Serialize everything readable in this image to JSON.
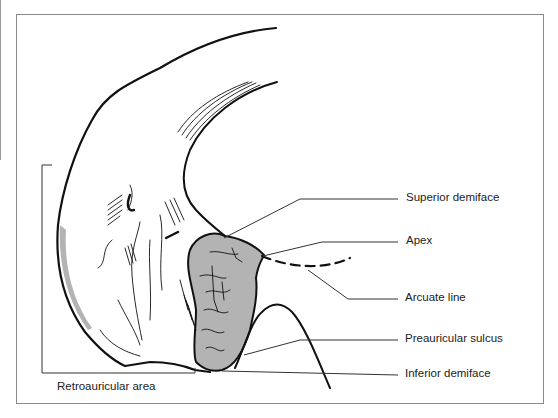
{
  "figure": {
    "labels": {
      "superior_demiface": "Superior demiface",
      "apex": "Apex",
      "arcuate_line": "Arcuate line",
      "preauricular_sulcus": "Preauricular sulcus",
      "inferior_demiface": "Inferior demiface",
      "retroauricular_area": "Retroauricular area"
    },
    "colors": {
      "outline": "#111111",
      "auricular_surface_fill": "#b3b3b3",
      "frame": "#8a8a8a",
      "leader": "#333333"
    }
  }
}
